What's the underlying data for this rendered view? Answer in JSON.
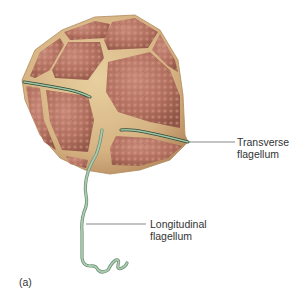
{
  "figure": {
    "panel_label": "(a)",
    "colors": {
      "background": "#ffffff",
      "cell_base": "#d9b98a",
      "plate_fill": "#b9786a",
      "plate_dark": "#9a5a4e",
      "suture": "#e6cf9c",
      "flagellum": "#9fc4a6",
      "flagellum_edge": "#3c5a44",
      "leader_line": "#555555",
      "text": "#333333"
    },
    "labels": [
      {
        "id": "transverse",
        "line1": "Transverse",
        "line2": "flagellum"
      },
      {
        "id": "longitudinal",
        "line1": "Longitudinal",
        "line2": "flagellum"
      }
    ]
  }
}
